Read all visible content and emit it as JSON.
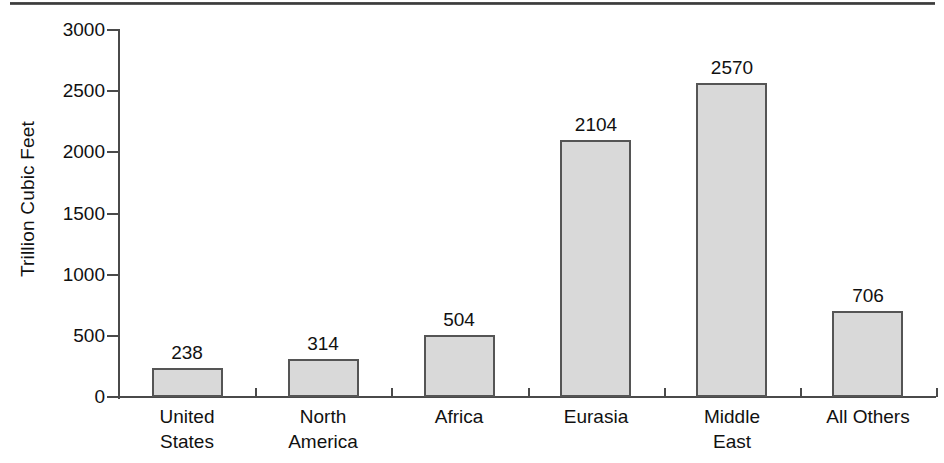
{
  "chart_data": {
    "type": "bar",
    "title": "",
    "subtitle": "",
    "xlabel": "",
    "ylabel": "Trillion Cubic Feet",
    "categories": [
      "United\nStates",
      "North\nAmerica",
      "Africa",
      "Eurasia",
      "Middle\nEast",
      "All Others"
    ],
    "category_lines": [
      [
        "United",
        "States"
      ],
      [
        "North",
        "America"
      ],
      [
        "Africa",
        ""
      ],
      [
        "Eurasia",
        ""
      ],
      [
        "Middle",
        "East"
      ],
      [
        "All Others",
        ""
      ]
    ],
    "values": [
      238,
      314,
      504,
      2104,
      2570,
      706
    ],
    "value_labels": [
      "238",
      "314",
      "504",
      "2104",
      "2570",
      "706"
    ],
    "ylim": [
      0,
      3000
    ],
    "yticks": [
      3000,
      2500,
      2000,
      1500,
      1000,
      500,
      0
    ],
    "ytick_labels": [
      "3000",
      "2500",
      "2000",
      "1500",
      "1000",
      "500",
      "0"
    ],
    "grid": false,
    "legend": false,
    "legend_position": "none",
    "bar_fill_color": "#d9d9d9",
    "bar_edge_color": "#555555",
    "axis_color": "#4a4a4a",
    "text_color": "#111111",
    "background_color": "#ffffff"
  }
}
